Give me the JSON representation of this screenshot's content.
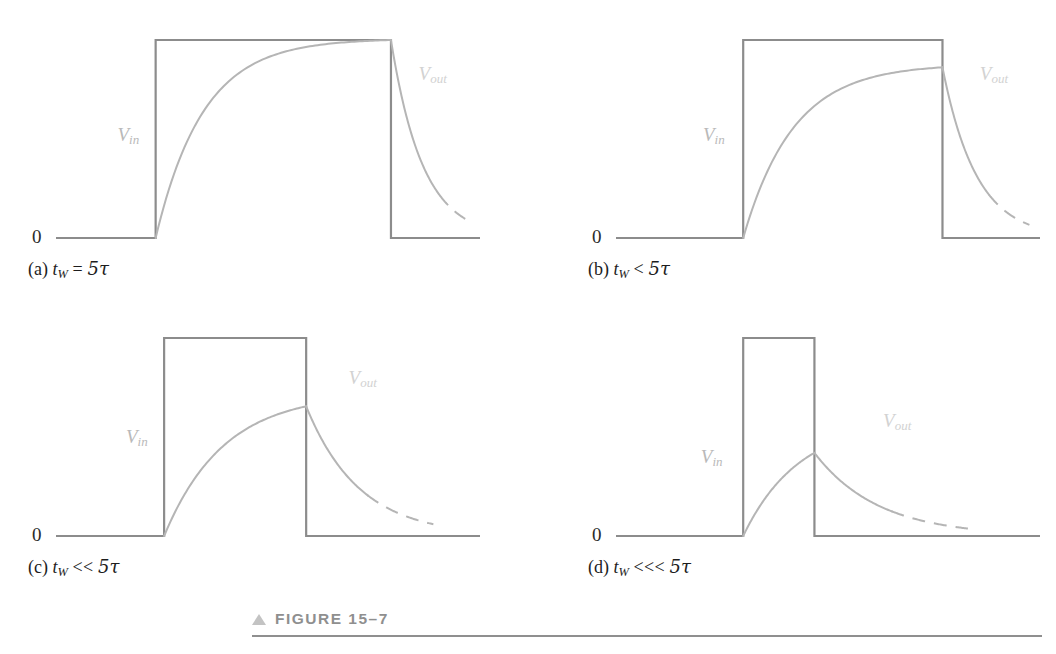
{
  "figure": {
    "number_label": "FIGURE 15–7",
    "marker_icon": "triangle-up-icon",
    "rule_color": "#8f8f8f"
  },
  "style": {
    "input_line_color": "#8c8c8c",
    "output_line_color": "#b5b5b5",
    "vin_label_color": "#b9b9b9",
    "vout_label_color": "#d2d2d2",
    "background": "#ffffff",
    "input_line_width": 2.2,
    "output_line_width": 2.0
  },
  "labels": {
    "zero": "0",
    "vin": "V",
    "vin_sub": "in",
    "vout": "V",
    "vout_sub": "out"
  },
  "chart_data": {
    "type": "line",
    "title": "FIGURE 15–7",
    "xlabel": "",
    "ylabel": "",
    "ylim": [
      0,
      1
    ],
    "grid": false,
    "legend": "inline-annotations",
    "series_names": [
      "Vin",
      "Vout"
    ],
    "panels": [
      {
        "id": "a",
        "caption_prefix": "(a)",
        "caption_var": "t",
        "caption_sub": "W",
        "caption_operator": "=",
        "caption_value": "5τ",
        "pulse_start": 0.235,
        "pulse_end": 0.79,
        "pulse_height": 1.0,
        "baseline": 0.0,
        "peak_value": 1.0,
        "charge_tau": 0.112,
        "discharge_tau": 0.075,
        "decay_solid_end": 0.905,
        "decay_dash_end": 0.975,
        "vin_label_x": 0.145,
        "vin_label_y": 0.52,
        "vout_label_x": 0.855,
        "vout_label_y": 0.83
      },
      {
        "id": "b",
        "caption_prefix": "(b)",
        "caption_var": "t",
        "caption_sub": "W",
        "caption_operator": "<",
        "caption_value": "5τ",
        "pulse_start": 0.3,
        "pulse_end": 0.77,
        "pulse_height": 1.0,
        "baseline": 0.0,
        "peak_value": 0.862,
        "charge_tau": 0.118,
        "discharge_tau": 0.08,
        "decay_solid_end": 0.88,
        "decay_dash_end": 0.975,
        "vin_label_x": 0.205,
        "vin_label_y": 0.52,
        "vout_label_x": 0.858,
        "vout_label_y": 0.83
      },
      {
        "id": "c",
        "caption_prefix": "(c)",
        "caption_var": "t",
        "caption_sub": "W",
        "caption_operator": "<<",
        "caption_value": "5τ",
        "pulse_start": 0.255,
        "pulse_end": 0.59,
        "pulse_height": 1.0,
        "baseline": 0.0,
        "peak_value": 0.655,
        "charge_tau": 0.14,
        "discharge_tau": 0.125,
        "decay_solid_end": 0.735,
        "decay_dash_end": 0.89,
        "vin_label_x": 0.165,
        "vin_label_y": 0.5,
        "vout_label_x": 0.69,
        "vout_label_y": 0.8
      },
      {
        "id": "d",
        "caption_prefix": "(d)",
        "caption_var": "t",
        "caption_sub": "W",
        "caption_operator": "<<<",
        "caption_value": "5τ",
        "pulse_start": 0.3,
        "pulse_end": 0.468,
        "pulse_height": 1.0,
        "baseline": 0.0,
        "peak_value": 0.42,
        "charge_tau": 0.13,
        "discharge_tau": 0.15,
        "decay_solid_end": 0.65,
        "decay_dash_end": 0.83,
        "vin_label_x": 0.2,
        "vin_label_y": 0.4,
        "vout_label_x": 0.63,
        "vout_label_y": 0.58
      }
    ]
  }
}
